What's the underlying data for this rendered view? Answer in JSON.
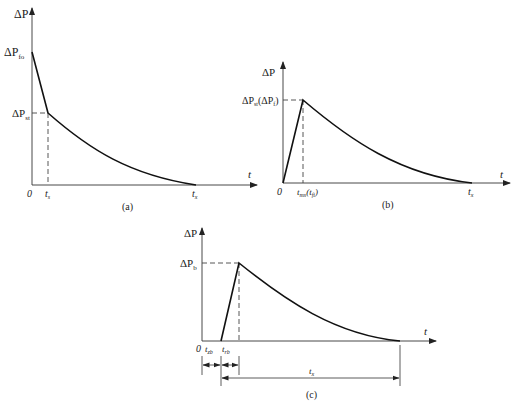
{
  "figures": [
    {
      "id": "a",
      "caption": "(a)",
      "y_axis_label": "ΔP",
      "x_axis_label": "t",
      "origin_label": "0",
      "y_ticks": [
        {
          "label": "ΔP",
          "sub": "fo"
        },
        {
          "label": "ΔP",
          "sub": "st"
        }
      ],
      "x_ticks": [
        {
          "label": "t",
          "sub": "s"
        },
        {
          "label": "t",
          "sub": "x"
        }
      ],
      "description": "Linear drop from ΔP_fo to ΔP_st at t_s, then exponential decay to zero at t_x"
    },
    {
      "id": "b",
      "caption": "(b)",
      "y_axis_label": "ΔP",
      "x_axis_label": "t",
      "origin_label": "0",
      "y_ticks": [
        {
          "label": "ΔP",
          "sub": "st",
          "paren_label": "(ΔP",
          "paren_sub": "f",
          "paren_close": ")"
        }
      ],
      "x_ticks": [
        {
          "label": "t",
          "sub": "ms",
          "paren_label": "(t",
          "paren_sub": "fi",
          "paren_close": ")"
        },
        {
          "label": "t",
          "sub": "x"
        }
      ],
      "description": "Linear rise from 0 to ΔP_st(ΔP_f) at t_ms(t_fi), then exponential decay to zero at t_x"
    },
    {
      "id": "c",
      "caption": "(c)",
      "y_axis_label": "ΔP",
      "x_axis_label": "t",
      "origin_label": "0",
      "y_ticks": [
        {
          "label": "ΔP",
          "sub": "b"
        }
      ],
      "x_ticks": [
        {
          "label": "t",
          "sub": "zb"
        },
        {
          "label": "t",
          "sub": "rb"
        }
      ],
      "dimension_label": {
        "label": "t",
        "sub": "x"
      },
      "description": "Zero until t_zb, linear rise to ΔP_b over t_rb, then exponential decay; t_x measured from start of rise to end"
    }
  ]
}
